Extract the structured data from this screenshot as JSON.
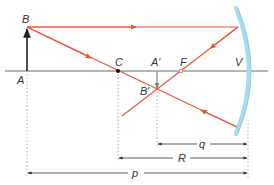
{
  "diagram": {
    "colors": {
      "ray": "#e8553a",
      "axis": "#6b6b6b",
      "mirror": "#a9dcea",
      "mirror_edge": "#7ec7dc",
      "arrow": "#222222",
      "guide": "#9a9a9a",
      "text": "#333333"
    },
    "points": {
      "A": {
        "label": "A",
        "x": 27,
        "y": 71
      },
      "B": {
        "label": "B",
        "x": 27,
        "y": 27
      },
      "C": {
        "label": "C",
        "x": 118,
        "y": 71
      },
      "A_prime": {
        "label": "A′",
        "x": 157,
        "y": 71
      },
      "B_prime": {
        "label": "B′",
        "x": 157,
        "y": 90
      },
      "F": {
        "label": "F",
        "x": 181,
        "y": 71
      },
      "V": {
        "label": "V",
        "x": 248,
        "y": 71
      }
    },
    "dimensions": {
      "q": {
        "label": "q",
        "from": "A_prime",
        "to": "V"
      },
      "R": {
        "label": "R",
        "from": "C",
        "to": "V"
      },
      "p": {
        "label": "p",
        "from": "A",
        "to": "V"
      }
    }
  }
}
